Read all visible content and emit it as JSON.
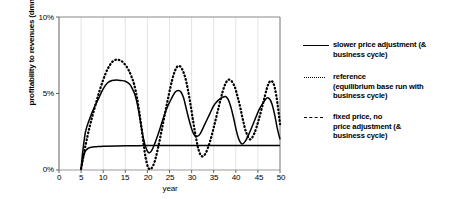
{
  "chart_data": {
    "type": "line",
    "title": "",
    "xlabel": "year",
    "ylabel": "profitability to revenues (dmnl)",
    "xlim": [
      0,
      50
    ],
    "ylim": [
      0,
      10
    ],
    "xticks": [
      "0",
      "5",
      "10",
      "15",
      "20",
      "25",
      "30",
      "35",
      "40",
      "45",
      "50"
    ],
    "yticks": [
      "0%",
      "5%",
      "10%"
    ],
    "grid": "vertical",
    "legend_position": "right",
    "series": [
      {
        "name": "slower price adjustment (& business cycle)",
        "style": "solid",
        "color": "#000000",
        "x": [
          5,
          5.3,
          6,
          7,
          8,
          9,
          10,
          11,
          12,
          13,
          14,
          15,
          16,
          16.6,
          17.2,
          17.8,
          18.4,
          19,
          19.6,
          20.2,
          20.8,
          21.5,
          22.5,
          23.5,
          24.5,
          25.5,
          26.3,
          27,
          27.6,
          28.2,
          28.8,
          29.4,
          30,
          30.6,
          31.3,
          32,
          33,
          34,
          35,
          36,
          37,
          37.7,
          38.3,
          38.9,
          39.5,
          40.1,
          40.7,
          41.4,
          42.2,
          43.2,
          44.2,
          45.2,
          46.2,
          47,
          47.6,
          48.2,
          48.8,
          49.4,
          50
        ],
        "y": [
          0,
          1.0,
          2.5,
          3.4,
          4.1,
          4.7,
          5.3,
          5.7,
          5.85,
          5.88,
          5.85,
          5.8,
          5.6,
          5.3,
          4.9,
          4.2,
          3.2,
          2.2,
          1.5,
          1.15,
          1.2,
          1.6,
          2.4,
          3.3,
          4.1,
          4.7,
          5.1,
          5.2,
          5.1,
          4.7,
          4.0,
          3.3,
          2.7,
          2.3,
          2.2,
          2.4,
          3.0,
          3.6,
          4.2,
          4.55,
          4.75,
          4.8,
          4.6,
          4.1,
          3.4,
          2.6,
          2.0,
          1.7,
          1.9,
          2.5,
          3.2,
          3.9,
          4.4,
          4.7,
          4.65,
          4.3,
          3.6,
          2.7,
          2.0
        ]
      },
      {
        "name": "reference (equilibrium base run with business cycle)",
        "style": "dotted",
        "color": "#000000",
        "x": [
          5,
          6,
          7,
          8,
          9,
          10,
          11,
          12,
          12.8,
          13.4,
          14,
          14.6,
          15.2,
          15.8,
          16.4,
          17,
          17.6,
          18.1,
          18.6,
          19.1,
          19.6,
          20.2,
          20.9,
          21.7,
          22.6,
          23.5,
          24.4,
          25.2,
          25.9,
          26.5,
          27,
          27.5,
          28,
          28.6,
          29.2,
          29.8,
          30.4,
          31,
          31.6,
          32.3,
          33.2,
          34.2,
          35.2,
          36.2,
          37,
          37.6,
          38.1,
          38.6,
          39.2,
          39.8,
          40.4,
          41,
          41.6,
          42.3,
          43.2,
          44.2,
          45.2,
          46.2,
          47,
          47.6,
          48.2,
          48.8,
          49.4,
          50
        ],
        "y": [
          0.1,
          1.6,
          2.9,
          4.0,
          5.0,
          5.9,
          6.6,
          7.05,
          7.2,
          7.2,
          7.15,
          7.0,
          6.8,
          6.5,
          6.1,
          5.6,
          4.8,
          3.9,
          2.9,
          1.8,
          0.8,
          0.15,
          0.1,
          0.6,
          1.7,
          3.0,
          4.3,
          5.4,
          6.2,
          6.65,
          6.8,
          6.75,
          6.5,
          6.0,
          5.2,
          4.2,
          3.1,
          2.1,
          1.3,
          0.9,
          1.1,
          1.9,
          3.0,
          4.2,
          5.1,
          5.6,
          5.85,
          5.9,
          5.75,
          5.4,
          4.8,
          4.1,
          3.3,
          2.5,
          2.0,
          2.4,
          3.3,
          4.4,
          5.3,
          5.75,
          5.8,
          5.4,
          4.4,
          3.0
        ]
      },
      {
        "name": "fixed price, no price adjustment (& business cycle)",
        "style": "dashed",
        "color": "#000000",
        "x": [
          5,
          5.4,
          6,
          6.8,
          7.6,
          8.5,
          10,
          15,
          20,
          25,
          30,
          35,
          40,
          45,
          50
        ],
        "y": [
          0,
          0.7,
          1.25,
          1.45,
          1.5,
          1.52,
          1.55,
          1.58,
          1.6,
          1.6,
          1.6,
          1.6,
          1.6,
          1.6,
          1.6
        ]
      }
    ]
  },
  "legend": {
    "items": [
      {
        "marker": "solid-line-marker",
        "line1": "slower price adjustment (&",
        "line2": "business cycle)",
        "line3": ""
      },
      {
        "marker": "dotted-line-marker",
        "line1": "reference",
        "line2": "(equilibrium base run with",
        "line3": "business cycle)"
      },
      {
        "marker": "dashed-line-marker",
        "line1": "fixed price, no",
        "line2": "price adjustment (&",
        "line3": "business cycle)"
      }
    ]
  }
}
